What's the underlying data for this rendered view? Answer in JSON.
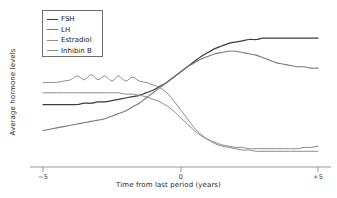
{
  "chart_data": {
    "type": "line",
    "title": "",
    "xlabel": "Time from last period (years)",
    "ylabel": "Average hormone levels",
    "xlim": [
      -5,
      5
    ],
    "ylim": [
      0,
      100
    ],
    "xticks": [
      -5,
      0,
      5
    ],
    "xtick_labels": [
      "−5",
      "0",
      "+5"
    ],
    "yticks": [],
    "ytick_labels": [],
    "grid": false,
    "legend_position": "upper-left",
    "x": [
      -5.0,
      -4.75,
      -4.5,
      -4.25,
      -4.0,
      -3.75,
      -3.5,
      -3.25,
      -3.0,
      -2.75,
      -2.5,
      -2.25,
      -2.0,
      -1.75,
      -1.5,
      -1.25,
      -1.0,
      -0.75,
      -0.5,
      -0.25,
      0.0,
      0.25,
      0.5,
      0.75,
      1.0,
      1.25,
      1.5,
      1.75,
      2.0,
      2.25,
      2.5,
      2.75,
      3.0,
      3.25,
      3.5,
      3.75,
      4.0,
      4.25,
      4.5,
      4.75,
      5.0
    ],
    "series": [
      {
        "name": "FSH",
        "color": "#3b3b3b",
        "width": 1.25,
        "values": [
          45,
          45,
          45,
          45,
          45,
          45,
          46,
          46,
          47,
          47,
          48,
          49,
          50,
          51,
          52,
          54,
          56,
          59,
          62,
          66,
          70,
          74,
          78,
          82,
          85,
          88,
          90,
          92,
          93,
          94,
          95,
          95,
          96,
          96,
          96,
          96,
          96,
          96,
          96,
          96,
          96
        ]
      },
      {
        "name": "LH",
        "color": "#7a7a7a",
        "width": 1.1,
        "values": [
          25,
          26,
          27,
          28,
          29,
          30,
          31,
          32,
          33,
          34,
          36,
          38,
          40,
          43,
          46,
          50,
          54,
          58,
          62,
          66,
          70,
          74,
          77,
          80,
          82,
          84,
          85,
          86,
          86,
          85,
          84,
          83,
          81,
          79,
          77,
          76,
          75,
          74,
          74,
          73,
          73
        ]
      },
      {
        "name": "Estradiol",
        "color": "#8c8c8c",
        "width": 1.0,
        "values": [
          62,
          62,
          62,
          63,
          64,
          67,
          64,
          68,
          64,
          67,
          63,
          67,
          63,
          66,
          63,
          62,
          60,
          58,
          54,
          48,
          41,
          34,
          27,
          22,
          18,
          15,
          13,
          12,
          11,
          10,
          10,
          9,
          9,
          9,
          9,
          9,
          9,
          9,
          9,
          9,
          9
        ]
      },
      {
        "name": "Inhibin B",
        "color": "#8c8c8c",
        "width": 1.0,
        "values": [
          54,
          54,
          54,
          54,
          54,
          54,
          54,
          54,
          54,
          54,
          54,
          54,
          53,
          53,
          52,
          51,
          49,
          47,
          44,
          40,
          35,
          30,
          25,
          21,
          18,
          16,
          14,
          13,
          12,
          12,
          11,
          11,
          11,
          11,
          11,
          11,
          11,
          11,
          12,
          12,
          13
        ]
      }
    ],
    "annotations": []
  },
  "axis": {
    "line_color": "#8a8a8a",
    "tick_labels": [
      "−5",
      "0",
      "+5"
    ]
  },
  "legend": {
    "border_color": "#6d6d6d",
    "items": [
      {
        "label": "FSH",
        "color": "#3b3b3b"
      },
      {
        "label": "LH",
        "color": "#7a7a7a"
      },
      {
        "label": "Estradiol",
        "color": "#8c8c8c"
      },
      {
        "label": "Inhibin B",
        "color": "#8c8c8c"
      }
    ]
  }
}
